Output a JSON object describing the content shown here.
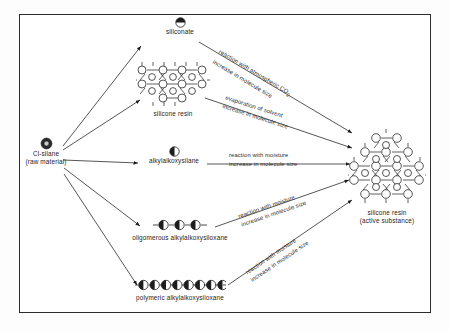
{
  "diagram": {
    "type": "process-flow",
    "frame_color": "#2b2b2b",
    "background": "#ffffff",
    "nodes": [
      {
        "id": "cl-silane",
        "label_line1": "Cl-silane",
        "label_line2": "(raw material)",
        "icon": "ring-circle-icon",
        "icon_desc": "dark ring with light centre"
      },
      {
        "id": "siliconate",
        "label_line1": "siliconate",
        "label_line2": "",
        "icon": "half-filled-top-circle-icon",
        "icon_desc": "circle with dark top half"
      },
      {
        "id": "silicone-resin-intermediate",
        "label_line1": "silicone resin",
        "label_line2": "",
        "icon": "honeycomb-lattice-icon",
        "icon_desc": "hexagonal network of open circles"
      },
      {
        "id": "alkylalkoxysilane",
        "label_line1": "alkylalkoxysilane",
        "label_line2": "",
        "icon": "half-filled-left-circle-icon",
        "icon_desc": "circle with dark left half"
      },
      {
        "id": "oligomerous-alkylalkoxysiloxane",
        "label_line1": "oligomerous alkylalkoxysiloxane",
        "label_line2": "",
        "icon": "three-bead-chain-icon",
        "icon_desc": "chain of 3 half-dark circles"
      },
      {
        "id": "polymeric-alkylalkoxysiloxane",
        "label_line1": "polymeric alkylalkoxysiloxane",
        "label_line2": "",
        "icon": "eight-bead-chain-icon",
        "icon_desc": "chain of 8 half-dark circles"
      },
      {
        "id": "silicone-resin-active",
        "label_line1": "silicone resin",
        "label_line2": "(active substance)",
        "icon": "large-honeycomb-lattice-icon",
        "icon_desc": "large hexagonal network of open circles"
      }
    ],
    "edges": [
      {
        "id": "edge-siliconate-to-resin",
        "from": "siliconate",
        "to": "silicone-resin-active",
        "line1": "reaction with atmospheric CO",
        "sub": "2",
        "line2": "increase in molecule size"
      },
      {
        "id": "edge-resin-intermediate-to-resin",
        "from": "silicone-resin-intermediate",
        "to": "silicone-resin-active",
        "line1": "evaporation of solvent",
        "sub": "",
        "line2": "increase in molecule size"
      },
      {
        "id": "edge-alkylalkoxysilane-to-resin",
        "from": "alkylalkoxysilane",
        "to": "silicone-resin-active",
        "line1": "reaction with moisture",
        "sub": "",
        "line2": "increase in molecule size"
      },
      {
        "id": "edge-oligomer-to-resin",
        "from": "oligomerous-alkylalkoxysiloxane",
        "to": "silicone-resin-active",
        "line1": "reaction with moisture",
        "sub": "",
        "line2": "increase in molecule size"
      },
      {
        "id": "edge-polymer-to-resin",
        "from": "polymeric-alkylalkoxysiloxane",
        "to": "silicone-resin-active",
        "line1": "reaction with moisture",
        "sub": "",
        "line2": "increase in molecule size"
      }
    ]
  }
}
